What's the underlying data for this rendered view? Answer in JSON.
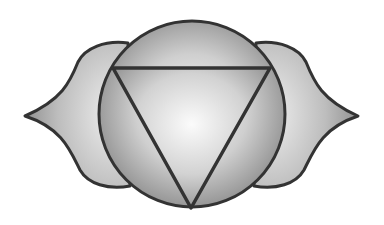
{
  "image": {
    "subject": "ajna-chakra-symbol",
    "elements": [
      "left-petal",
      "right-petal",
      "central-circle",
      "inverted-triangle"
    ],
    "colors": {
      "background": "#ffffff",
      "outline": "#333333",
      "fill_light": "#f4f4f4",
      "fill_dark": "#9a9a9a"
    }
  }
}
